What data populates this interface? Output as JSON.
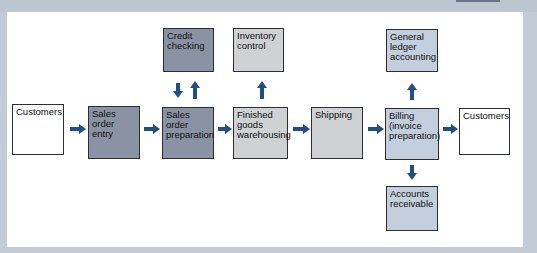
{
  "diagram": {
    "nodes": [
      {
        "id": "customers_in",
        "label": "Customers"
      },
      {
        "id": "sales_order_entry",
        "label": "Sales\norder\nentry"
      },
      {
        "id": "credit_checking",
        "label": "Credit\nchecking"
      },
      {
        "id": "sales_order_preparation",
        "label": "Sales\norder\npreparation"
      },
      {
        "id": "inventory_control",
        "label": "Inventory\ncontrol"
      },
      {
        "id": "finished_goods",
        "label": "Finished\ngoods\nwarehousing"
      },
      {
        "id": "shipping",
        "label": "Shipping"
      },
      {
        "id": "general_ledger",
        "label": "General\nledger\naccounting"
      },
      {
        "id": "billing",
        "label": "Billing\n(invoice\npreparation)"
      },
      {
        "id": "accounts_receivable",
        "label": "Accounts\nreceivable"
      },
      {
        "id": "customers_out",
        "label": "Customers"
      }
    ],
    "edges": [
      {
        "from": "customers_in",
        "to": "sales_order_entry"
      },
      {
        "from": "sales_order_entry",
        "to": "sales_order_preparation"
      },
      {
        "from": "credit_checking",
        "to": "sales_order_preparation"
      },
      {
        "from": "sales_order_preparation",
        "to": "credit_checking"
      },
      {
        "from": "sales_order_preparation",
        "to": "finished_goods"
      },
      {
        "from": "finished_goods",
        "to": "inventory_control"
      },
      {
        "from": "finished_goods",
        "to": "shipping"
      },
      {
        "from": "shipping",
        "to": "billing"
      },
      {
        "from": "billing",
        "to": "general_ledger"
      },
      {
        "from": "billing",
        "to": "accounts_receivable"
      },
      {
        "from": "billing",
        "to": "customers_out"
      }
    ],
    "colors": {
      "arrow": "#1f4e8c",
      "dark_box": "#8a93a3",
      "light_box": "#cfd1d3",
      "blue_box": "#c3cfdc",
      "shadow": "#8e9399"
    }
  }
}
